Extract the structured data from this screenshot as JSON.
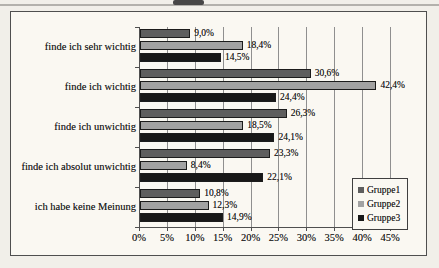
{
  "chart_data": {
    "type": "bar",
    "orientation": "horizontal",
    "title": "",
    "categories": [
      "finde ich sehr wichtig",
      "finde ich wichtig",
      "finde ich unwichtig",
      "finde ich absolut unwichtig",
      "ich habe keine Meinung"
    ],
    "series": [
      {
        "name": "Gruppe1",
        "color": "#5e5e5e",
        "values": [
          9.0,
          30.6,
          26.3,
          23.3,
          10.8
        ],
        "value_labels": [
          "9,0%",
          "30,6%",
          "26,3%",
          "23,3%",
          "10,8%"
        ]
      },
      {
        "name": "Gruppe2",
        "color": "#a2a2a2",
        "values": [
          18.4,
          42.4,
          18.5,
          8.4,
          12.3
        ],
        "value_labels": [
          "18,4%",
          "42,4%",
          "18,5%",
          "8,4%",
          "12,3%"
        ]
      },
      {
        "name": "Gruppe3",
        "color": "#181818",
        "values": [
          14.5,
          24.4,
          24.1,
          22.1,
          14.9
        ],
        "value_labels": [
          "14,5%",
          "24,4%",
          "24,1%",
          "22,1%",
          "14,9%"
        ]
      }
    ],
    "x_axis": {
      "min": 0,
      "max": 45,
      "step": 5,
      "tick_labels": [
        "0%",
        "5%",
        "10%",
        "15%",
        "20%",
        "25%",
        "30%",
        "35%",
        "40%",
        "45%"
      ]
    },
    "legend": {
      "position": "bottom-right-inside",
      "entries": [
        "Gruppe1",
        "Gruppe2",
        "Gruppe3"
      ]
    },
    "grid": true,
    "colors": {
      "frame_background": "#faf8f2",
      "page_background": "#f1efe9",
      "gridline": "#8f8f8f",
      "axis": "#4f4f4f",
      "text": "#1d1d1d"
    }
  }
}
